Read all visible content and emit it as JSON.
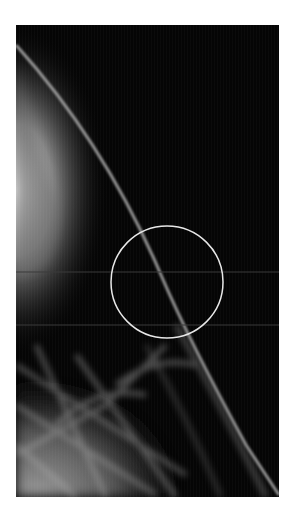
{
  "image": {
    "type": "x-ray",
    "description": "Grayscale mammogram-style radiograph with a curved tissue edge line and a circled region of interest",
    "frame": {
      "x": 16,
      "y": 25,
      "width": 263,
      "height": 472
    },
    "background_color": "#050505"
  },
  "annotation": {
    "shape": "circle",
    "center": {
      "x": 167,
      "y": 282
    },
    "radius": 56,
    "stroke_color": "#e8e8e8"
  },
  "guide_lines": [
    {
      "orientation": "horizontal",
      "y": 272,
      "color": "#3a3a3a"
    },
    {
      "orientation": "horizontal",
      "y": 325,
      "color": "#3a3a3a"
    }
  ]
}
